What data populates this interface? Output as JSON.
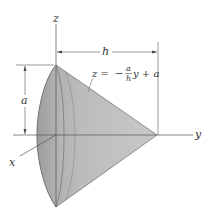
{
  "figure": {
    "type": "cone-geometry-diagram",
    "axes": {
      "z": "z",
      "y": "y",
      "x": "x"
    },
    "dimensions": {
      "height_label": "a",
      "length_label": "h"
    },
    "equation": {
      "lhs": "z =",
      "sign": "−",
      "frac_num": "a",
      "frac_den": "h",
      "rest": "y + a"
    },
    "colors": {
      "fill": "#b3b3b3",
      "stroke": "#444444",
      "text": "#333333"
    }
  }
}
